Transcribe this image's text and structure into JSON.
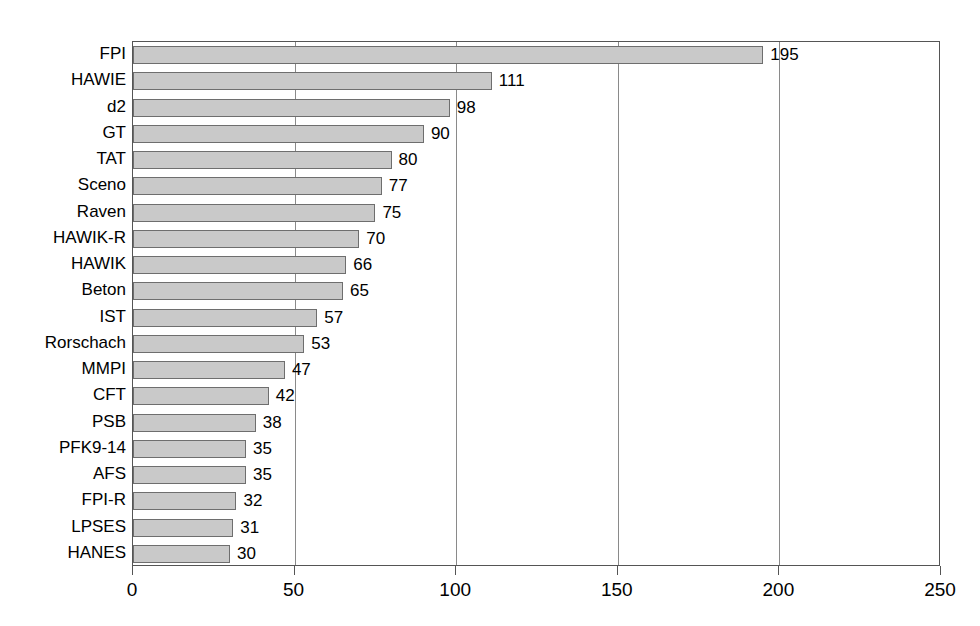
{
  "chart_data": {
    "type": "bar",
    "orientation": "horizontal",
    "title": "",
    "subtitle": "",
    "xlabel": "",
    "ylabel": "",
    "xlim": [
      0,
      250
    ],
    "xticks": [
      0,
      50,
      100,
      150,
      200,
      250
    ],
    "xticklabels": [
      "0",
      "50",
      "100",
      "150",
      "200",
      "250"
    ],
    "gridlines": [
      50,
      100,
      150,
      200
    ],
    "grid": true,
    "legend": null,
    "bar_color": "#c9c9c9",
    "bar_edge_color": "#6e6e6e",
    "axis_color": "#555555",
    "categories": [
      "FPI",
      "HAWIE",
      "d2",
      "GT",
      "TAT",
      "Sceno",
      "Raven",
      "HAWIK-R",
      "HAWIK",
      "Beton",
      "IST",
      "Rorschach",
      "MMPI",
      "CFT",
      "PSB",
      "PFK9-14",
      "AFS",
      "FPI-R",
      "LPSES",
      "HANES"
    ],
    "values": [
      195,
      111,
      98,
      90,
      80,
      77,
      75,
      70,
      66,
      65,
      57,
      53,
      47,
      42,
      38,
      35,
      35,
      32,
      31,
      30
    ],
    "value_labels": [
      "195",
      "111",
      "98",
      "90",
      "80",
      "77",
      "75",
      "70",
      "66",
      "65",
      "57",
      "53",
      "47",
      "42",
      "38",
      "35",
      "35",
      "32",
      "31",
      "30"
    ]
  }
}
